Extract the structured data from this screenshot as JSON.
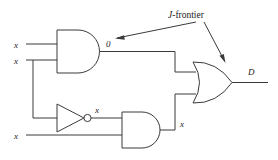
{
  "figure": {
    "background_color": "#ffffff",
    "line_color": "#3a3a3a",
    "text_color": "#1c1c1c"
  },
  "annotation": {
    "label": "J-frontier",
    "label_italic_prefix": "J",
    "label_rest": "-frontier",
    "pointer_count": 2,
    "pointer_targets": [
      "and-gate-1-output-value",
      "or-gate-1"
    ]
  },
  "inputs": [
    {
      "id": "in-1",
      "label": "x",
      "gate": "and-gate-1",
      "pin": "top"
    },
    {
      "id": "in-2",
      "label": "x",
      "gate": "and-gate-1",
      "pin": "bottom"
    },
    {
      "id": "in-3",
      "label": "x",
      "gate": "and-gate-2",
      "pin": "bottom"
    }
  ],
  "gates": [
    {
      "id": "and-gate-1",
      "type": "AND",
      "inputs": 2,
      "output_label": "0"
    },
    {
      "id": "inverter-1",
      "type": "NOT",
      "inputs": 1,
      "output_label": "x"
    },
    {
      "id": "and-gate-2",
      "type": "AND",
      "inputs": 2,
      "output_label": "x"
    },
    {
      "id": "or-gate-1",
      "type": "OR",
      "inputs": 2,
      "output_label": "D"
    }
  ],
  "net_labels": {
    "and1_output": "0",
    "inverter_output": "x",
    "and2_output": "x",
    "circuit_output": "D"
  }
}
